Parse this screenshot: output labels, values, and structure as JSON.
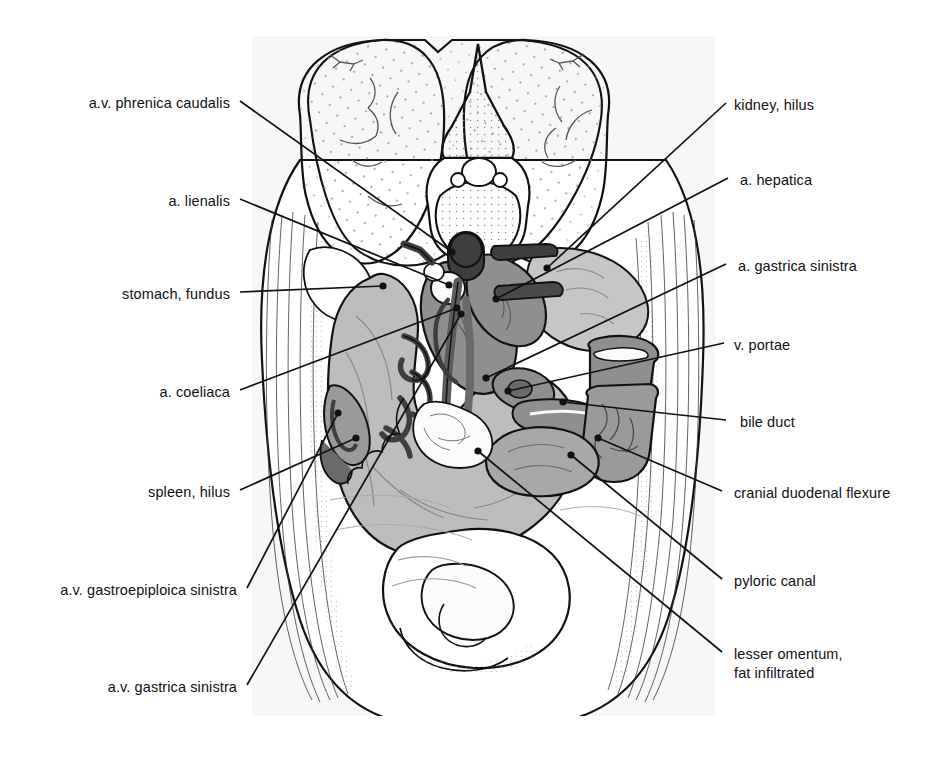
{
  "figure": {
    "type": "anatomical-cross-section",
    "panel": {
      "x": 252,
      "y": 36,
      "width": 463,
      "height": 680,
      "background": "#f7f7f7"
    },
    "palette": {
      "ink": "#111111",
      "organ_light": "#c6c6c6",
      "organ_mid": "#9a9a9a",
      "vessel_dark": "#6a6a6a",
      "vessel_darkest": "#3e3e3e",
      "fat_white": "#fbfbfb",
      "stipple": "#8c8c8c"
    }
  },
  "labels_left": [
    {
      "id": "a-v-phrenica-caudalis",
      "text": "a.v. phrenica caudalis",
      "x": 84,
      "y": 94,
      "anchor_x": 240,
      "anchor_y": 101,
      "target_x": 452,
      "target_y": 252
    },
    {
      "id": "a-lienalis",
      "text": "a. lienalis",
      "x": 166,
      "y": 192,
      "anchor_x": 240,
      "anchor_y": 199,
      "target_x": 449,
      "target_y": 285
    },
    {
      "id": "stomach-fundus",
      "text": "stomach, fundus",
      "x": 118,
      "y": 285,
      "anchor_x": 240,
      "anchor_y": 292,
      "target_x": 383,
      "target_y": 286
    },
    {
      "id": "a-coeliaca",
      "text": "a. coeliaca",
      "x": 155,
      "y": 383,
      "anchor_x": 240,
      "anchor_y": 390,
      "target_x": 457,
      "target_y": 308
    },
    {
      "id": "spleen-hilus",
      "text": "spleen, hilus",
      "x": 148,
      "y": 483,
      "anchor_x": 240,
      "anchor_y": 490,
      "target_x": 356,
      "target_y": 438
    },
    {
      "id": "a-v-gastroepiploica-sin",
      "text": "a.v. gastroepiploica sinistra",
      "x": 78,
      "y": 581,
      "anchor_x": 247,
      "anchor_y": 588,
      "target_x": 338,
      "target_y": 413
    },
    {
      "id": "a-v-gastrica-sinistra",
      "text": "a.v. gastrica sinistra",
      "x": 95,
      "y": 678,
      "anchor_x": 247,
      "anchor_y": 685,
      "target_x": 461,
      "target_y": 314
    }
  ],
  "labels_right": [
    {
      "id": "kidney-hilus",
      "text": "kidney, hilus",
      "x": 734,
      "y": 96,
      "anchor_x": 726,
      "anchor_y": 103,
      "target_x": 547,
      "target_y": 268
    },
    {
      "id": "a-hepatica",
      "text": "a. hepatica",
      "x": 740,
      "y": 171,
      "anchor_x": 728,
      "anchor_y": 178,
      "target_x": 496,
      "target_y": 299
    },
    {
      "id": "a-gastrica-sinistra",
      "text": "a. gastrica sinistra",
      "x": 738,
      "y": 257,
      "anchor_x": 726,
      "anchor_y": 264,
      "target_x": 486,
      "target_y": 378
    },
    {
      "id": "v-portae",
      "text": "v. portae",
      "x": 734,
      "y": 336,
      "anchor_x": 724,
      "anchor_y": 343,
      "target_x": 508,
      "target_y": 391
    },
    {
      "id": "bile-duct",
      "text": "bile duct",
      "x": 740,
      "y": 413,
      "anchor_x": 726,
      "anchor_y": 420,
      "target_x": 563,
      "target_y": 402
    },
    {
      "id": "cranial-duodenal-flexure",
      "text": "cranial duodenal flexure",
      "x": 734,
      "y": 484,
      "anchor_x": 722,
      "anchor_y": 491,
      "target_x": 598,
      "target_y": 438
    },
    {
      "id": "pyloric-canal",
      "text": "pyloric canal",
      "x": 734,
      "y": 572,
      "anchor_x": 722,
      "anchor_y": 579,
      "target_x": 571,
      "target_y": 455
    },
    {
      "id": "lesser-omentum",
      "text": "lesser omentum,",
      "x": 734,
      "y": 645,
      "anchor_x": 722,
      "anchor_y": 652,
      "target_x": 478,
      "target_y": 451,
      "text_line2": "fat infiltrated"
    }
  ],
  "structures": [
    {
      "id": "vertebra",
      "name": "lumbar vertebra"
    },
    {
      "id": "kidney-left",
      "name": "kidney"
    },
    {
      "id": "kidney-right",
      "name": "kidney"
    },
    {
      "id": "liver",
      "name": "liver lobes"
    },
    {
      "id": "stomach",
      "name": "stomach"
    },
    {
      "id": "spleen",
      "name": "spleen"
    },
    {
      "id": "duodenum",
      "name": "duodenum"
    },
    {
      "id": "aorta",
      "name": "aorta"
    },
    {
      "id": "vena-cava",
      "name": "caudal vena cava"
    },
    {
      "id": "body-wall",
      "name": "abdominal body wall"
    }
  ]
}
